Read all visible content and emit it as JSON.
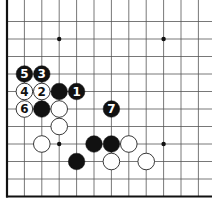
{
  "diagram": {
    "type": "go-board-fragment",
    "grid": {
      "origin_x": 7,
      "origin_y": 4,
      "step_x": 17.4,
      "step_y": 17.5,
      "cols": 12,
      "rows": 12,
      "line_color": "#555555",
      "edge_color": "#111111",
      "left_edge": true,
      "bottom_edge": true
    },
    "star_points": [
      {
        "col": 3,
        "row": 2
      },
      {
        "col": 9,
        "row": 2
      },
      {
        "col": 3,
        "row": 8
      },
      {
        "col": 9,
        "row": 8
      }
    ],
    "stones": [
      {
        "color": "black",
        "col": 1,
        "row": 4,
        "label": "5"
      },
      {
        "color": "black",
        "col": 2,
        "row": 4,
        "label": "3"
      },
      {
        "color": "white",
        "col": 1,
        "row": 5,
        "label": "4"
      },
      {
        "color": "white",
        "col": 2,
        "row": 5,
        "label": "2"
      },
      {
        "color": "black",
        "col": 3,
        "row": 5,
        "label": ""
      },
      {
        "color": "black",
        "col": 4,
        "row": 5,
        "label": "1"
      },
      {
        "color": "white",
        "col": 1,
        "row": 6,
        "label": "6"
      },
      {
        "color": "black",
        "col": 2,
        "row": 6,
        "label": ""
      },
      {
        "color": "white",
        "col": 3,
        "row": 6,
        "label": ""
      },
      {
        "color": "black",
        "col": 6,
        "row": 6,
        "label": "7"
      },
      {
        "color": "white",
        "col": 3,
        "row": 7,
        "label": ""
      },
      {
        "color": "white",
        "col": 2,
        "row": 8,
        "label": ""
      },
      {
        "color": "black",
        "col": 5,
        "row": 8,
        "label": ""
      },
      {
        "color": "black",
        "col": 6,
        "row": 8,
        "label": ""
      },
      {
        "color": "white",
        "col": 7,
        "row": 8,
        "label": ""
      },
      {
        "color": "black",
        "col": 4,
        "row": 9,
        "label": ""
      },
      {
        "color": "white",
        "col": 6,
        "row": 9,
        "label": ""
      },
      {
        "color": "white",
        "col": 8,
        "row": 9,
        "label": ""
      }
    ],
    "colors": {
      "black_stone": "#111111",
      "white_stone": "#ffffff",
      "white_outline": "#222222",
      "black_label": "#ffffff",
      "white_label": "#111111"
    }
  }
}
